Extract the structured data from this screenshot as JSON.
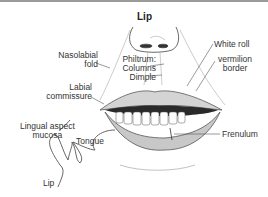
{
  "diagram": {
    "title": "Lip",
    "labels": {
      "nasolabial_1": "Nasolabial",
      "nasolabial_2": "fold",
      "labial_1": "Labial",
      "labial_2": "commissure",
      "philtrum": "Philtrum:",
      "columns": "Columns",
      "dimple": "Dimple",
      "white_roll": "White roll",
      "vermilion_1": "vermilion",
      "vermilion_2": "border",
      "frenulum": "Frenulum",
      "lingual_1": "Lingual aspect",
      "lingual_2": "mucosa",
      "tongue": "Tongue",
      "lip_inset": "Lip"
    },
    "colors": {
      "line": "#555555",
      "text": "#333333",
      "lip_shade": "#bdbdbd",
      "mouth_dark": "#2a2a2a"
    }
  }
}
